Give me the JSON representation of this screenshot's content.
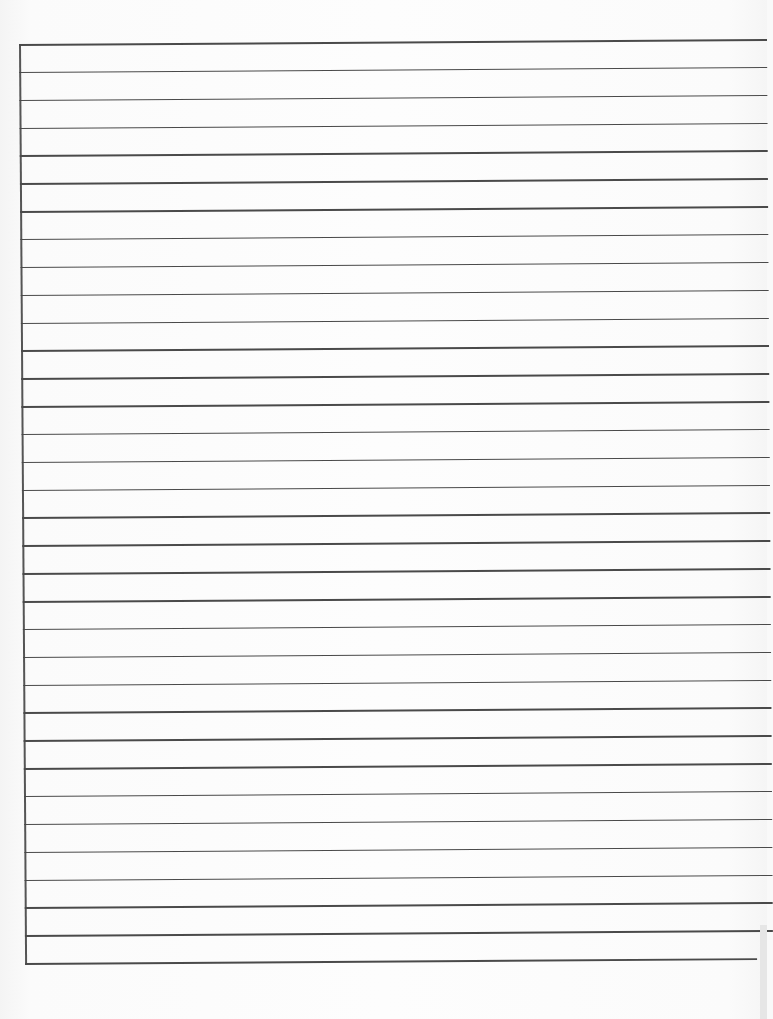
{
  "document": {
    "type": "lined-paper",
    "line_count": 34,
    "first_line_y": 44,
    "line_spacing": 27.85,
    "left_margin_x": 19,
    "line_width": 748,
    "last_line_width": 732,
    "line_color": "#4a4a4a",
    "margin_rule_color": "#555555",
    "paper_color": "#fdfdfd"
  }
}
